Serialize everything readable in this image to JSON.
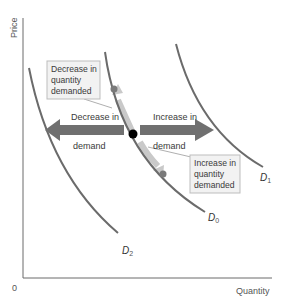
{
  "axes": {
    "y_label": "Price",
    "x_label": "Quantity",
    "origin_label": "0"
  },
  "curves": {
    "d0": {
      "label": "D",
      "sub": "0"
    },
    "d1": {
      "label": "D",
      "sub": "1"
    },
    "d2": {
      "label": "D",
      "sub": "2"
    }
  },
  "annotations": {
    "decrease_qd": [
      "Decrease in",
      "quantity",
      "demanded"
    ],
    "increase_qd": [
      "Increase in",
      "quantity",
      "demanded"
    ],
    "decrease_demand": [
      "Decrease in",
      "demand"
    ],
    "increase_demand": [
      "Increase in",
      "demand"
    ]
  },
  "colors": {
    "curve": "#6b6b6b",
    "arrow": "#707070",
    "along_arrow": "#c9c9c9",
    "point_gray": "#7a7a7a",
    "point_black": "#000000",
    "box_fill": "#f2f2f2",
    "box_stroke": "#bdbdbd"
  }
}
